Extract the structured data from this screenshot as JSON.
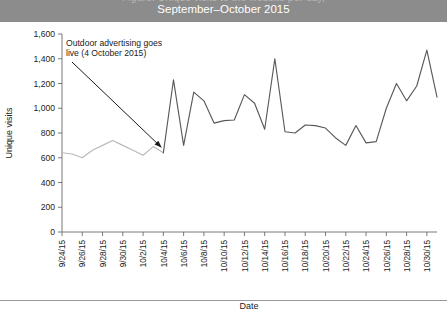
{
  "header": {
    "cropped_line_above": "Figure: Unique visits to the website per day,",
    "title": "September–October 2015"
  },
  "chart_data": {
    "type": "line",
    "title": "September–October 2015",
    "xlabel": "Date",
    "ylabel": "Unique visits",
    "ylim": [
      0,
      1600
    ],
    "ytick_step": 200,
    "ytick_labels": [
      "0",
      "200",
      "400",
      "600",
      "800",
      "1,000",
      "1,200",
      "1,400",
      "1,600"
    ],
    "ytick_values": [
      0,
      200,
      400,
      600,
      800,
      1000,
      1200,
      1400,
      1600
    ],
    "xtick_labels": [
      "9/24/15",
      "9/26/15",
      "9/28/15",
      "9/30/15",
      "10/2/15",
      "10/4/15",
      "10/6/15",
      "10/8/15",
      "10/10/15",
      "10/12/15",
      "10/14/15",
      "10/16/15",
      "10/18/15",
      "10/20/15",
      "10/22/15",
      "10/24/15",
      "10/26/15",
      "10/28/15",
      "10/30/15"
    ],
    "xtick_interval_days": 2,
    "grid": false,
    "legend": "none",
    "x": [
      "9/24/15",
      "9/25/15",
      "9/26/15",
      "9/27/15",
      "9/28/15",
      "9/29/15",
      "9/30/15",
      "10/1/15",
      "10/2/15",
      "10/3/15",
      "10/4/15",
      "10/5/15",
      "10/6/15",
      "10/7/15",
      "10/8/15",
      "10/9/15",
      "10/10/15",
      "10/11/15",
      "10/12/15",
      "10/13/15",
      "10/14/15",
      "10/15/15",
      "10/16/15",
      "10/17/15",
      "10/18/15",
      "10/19/15",
      "10/20/15",
      "10/21/15",
      "10/22/15",
      "10/23/15",
      "10/24/15",
      "10/25/15",
      "10/26/15",
      "10/27/15",
      "10/28/15",
      "10/29/15",
      "10/30/15",
      "10/31/15"
    ],
    "values": [
      640,
      630,
      600,
      660,
      700,
      740,
      700,
      660,
      620,
      690,
      640,
      1230,
      700,
      1130,
      1060,
      880,
      900,
      905,
      1110,
      1040,
      830,
      1400,
      810,
      800,
      865,
      860,
      840,
      760,
      700,
      860,
      720,
      730,
      1000,
      1200,
      1060,
      1180,
      1470,
      1090
    ],
    "segments": [
      {
        "name": "before-campaign",
        "color": "#b9b9b9",
        "from": "9/24/15",
        "to": "10/4/15"
      },
      {
        "name": "after-campaign",
        "color": "#5a5a5a",
        "from": "10/4/15",
        "to": "10/31/15"
      }
    ],
    "annotations": [
      {
        "name": "campaign-launch",
        "line1": "Outdoor advertising goes",
        "line2": "live (4 October 2015)",
        "points_to": "10/4/15"
      }
    ]
  }
}
